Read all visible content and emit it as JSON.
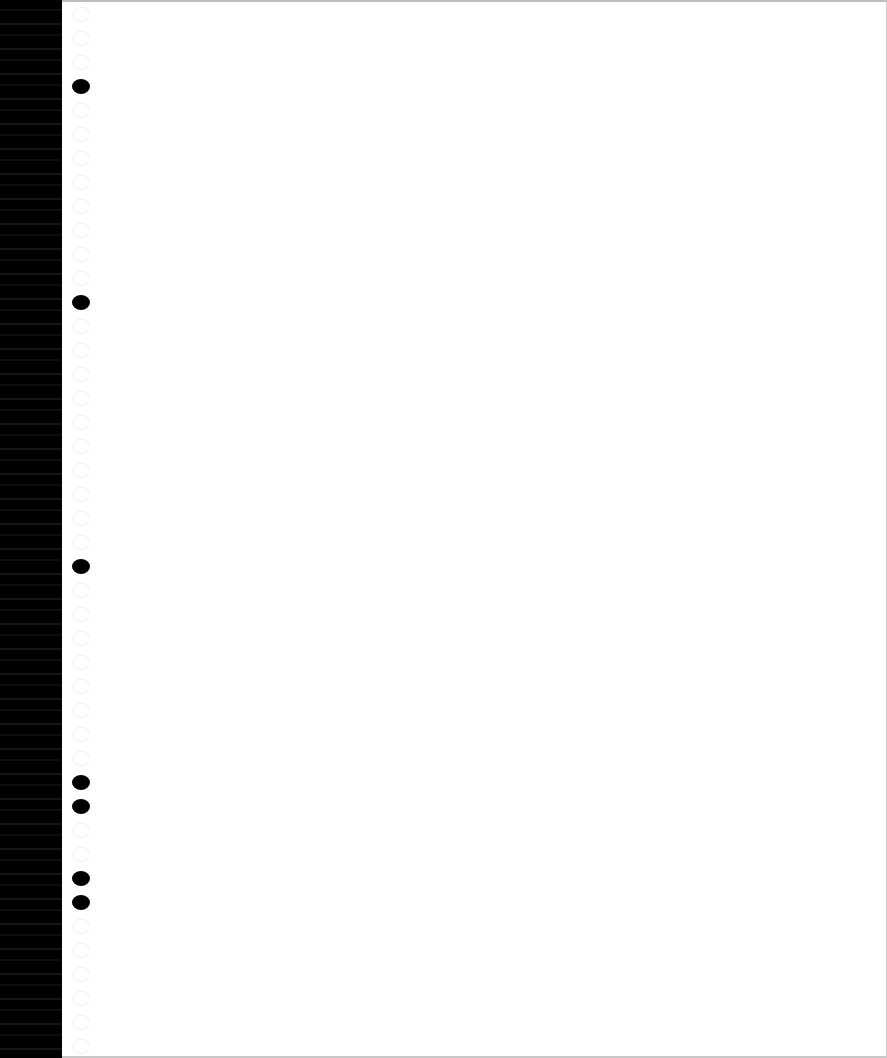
{
  "document": {
    "type": "blank continuous-feed page",
    "content_text": "",
    "colors": {
      "page": "#ffffff",
      "edge_strip": "#000000",
      "punched_hole": "#000000",
      "unpunched_hole_outline": "#f0f0f0"
    },
    "margin_holes": {
      "pitch_px": 24,
      "first_y_px": 14,
      "count": 44,
      "punched_y_px": [
        86,
        299,
        563,
        776,
        800,
        871,
        895,
        966,
        990
      ]
    }
  }
}
